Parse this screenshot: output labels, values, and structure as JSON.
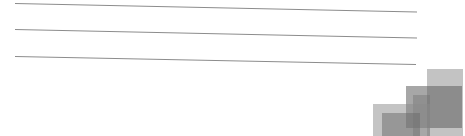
{
  "lines": [
    {
      "x1": 15,
      "y1": 3.5,
      "x2": 417,
      "y2": 12
    },
    {
      "x1": 15,
      "y1": 29.5,
      "x2": 417,
      "y2": 38
    },
    {
      "x1": 15,
      "y1": 56.5,
      "x2": 416,
      "y2": 64.5
    }
  ],
  "line_color": "#8c8c8c",
  "squares": [
    {
      "name": "square-top-right",
      "x": 427,
      "y": 69,
      "w": 36,
      "h": 67,
      "color": "#7a7a7a",
      "opacity": 0.45
    },
    {
      "name": "square-mid-right",
      "x": 406,
      "y": 86,
      "w": 56,
      "h": 42,
      "color": "#5e5e5e",
      "opacity": 0.55
    },
    {
      "name": "square-inner",
      "x": 413,
      "y": 95,
      "w": 17,
      "h": 41,
      "color": "#6e6e6e",
      "opacity": 0.4
    },
    {
      "name": "square-left",
      "x": 373,
      "y": 104,
      "w": 57,
      "h": 32,
      "color": "#8a8a8a",
      "opacity": 0.5
    },
    {
      "name": "square-left-inner",
      "x": 382,
      "y": 113,
      "w": 38,
      "h": 23,
      "color": "#6a6a6a",
      "opacity": 0.5
    }
  ]
}
